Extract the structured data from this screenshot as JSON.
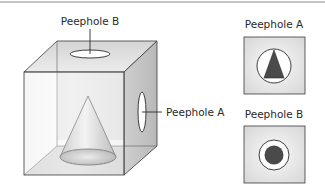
{
  "figure": {
    "top_rule": true,
    "cube": {
      "label_top": "Peephole B",
      "label_side": "Peephole A",
      "contents": "cone"
    },
    "panels": [
      {
        "id": "A",
        "label": "Peephole A",
        "view": "triangle-in-circle"
      },
      {
        "id": "B",
        "label": "Peephole B",
        "view": "dot-in-circle"
      }
    ],
    "colors": {
      "line": "#3a3a3a",
      "face_light": "#f2f2f2",
      "face_mid": "#d9d9d9",
      "face_dark": "#bdbdbd",
      "fill_dark": "#4a4a4a",
      "rule": "#8a8a8a"
    }
  }
}
